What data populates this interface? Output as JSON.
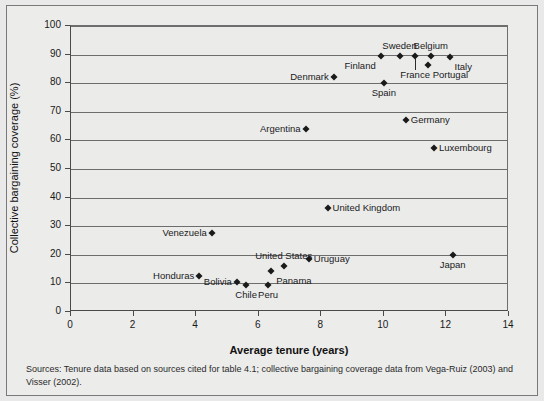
{
  "chart_data": {
    "type": "scatter",
    "title": "",
    "xlabel": "Average tenure (years)",
    "ylabel": "Collective bargaining coverage (%)",
    "xlim": [
      0,
      14
    ],
    "ylim": [
      0,
      100
    ],
    "xticks": [
      0,
      2,
      4,
      6,
      8,
      10,
      12,
      14
    ],
    "yticks": [
      0,
      10,
      20,
      30,
      40,
      50,
      60,
      70,
      80,
      90,
      100
    ],
    "grid": "horizontal",
    "legend": "none",
    "points": [
      {
        "label": "Sweden",
        "x": 10.5,
        "y": 89.5,
        "label_pos": "above",
        "leader": false
      },
      {
        "label": "Belgium",
        "x": 11.5,
        "y": 89.5,
        "label_pos": "above",
        "leader": false
      },
      {
        "label": "Italy",
        "x": 12.1,
        "y": 89.0,
        "label_pos": "below-right",
        "leader": false
      },
      {
        "label": "Finland",
        "x": 9.9,
        "y": 89.5,
        "label_pos": "below-left",
        "leader": false
      },
      {
        "label": "France",
        "x": 11.0,
        "y": 89.5,
        "label_pos": "below",
        "leader": true
      },
      {
        "label": "Portugal",
        "x": 11.4,
        "y": 86.5,
        "label_pos": "below-right",
        "leader": false
      },
      {
        "label": "Denmark",
        "x": 8.4,
        "y": 82.0,
        "label_pos": "left",
        "leader": false
      },
      {
        "label": "Spain",
        "x": 10.0,
        "y": 80.0,
        "label_pos": "below",
        "leader": false
      },
      {
        "label": "Germany",
        "x": 10.7,
        "y": 67.0,
        "label_pos": "right",
        "leader": false
      },
      {
        "label": "Argentina",
        "x": 7.5,
        "y": 64.0,
        "label_pos": "left",
        "leader": false
      },
      {
        "label": "Luxembourg",
        "x": 11.6,
        "y": 57.5,
        "label_pos": "right",
        "leader": false
      },
      {
        "label": "United Kingdom",
        "x": 8.2,
        "y": 36.5,
        "label_pos": "right",
        "leader": false
      },
      {
        "label": "Venezuela",
        "x": 4.5,
        "y": 27.5,
        "label_pos": "left",
        "leader": false
      },
      {
        "label": "Japan",
        "x": 12.2,
        "y": 20.0,
        "label_pos": "below",
        "leader": false
      },
      {
        "label": "Uruguay",
        "x": 7.6,
        "y": 18.5,
        "label_pos": "right",
        "leader": false
      },
      {
        "label": "United States",
        "x": 6.8,
        "y": 16.0,
        "label_pos": "above",
        "leader": false
      },
      {
        "label": "Panama",
        "x": 6.4,
        "y": 14.5,
        "label_pos": "below-right",
        "leader": false
      },
      {
        "label": "Honduras",
        "x": 4.1,
        "y": 12.5,
        "label_pos": "left",
        "leader": false
      },
      {
        "label": "Bolivia",
        "x": 5.3,
        "y": 10.5,
        "label_pos": "left",
        "leader": false
      },
      {
        "label": "Chile",
        "x": 5.6,
        "y": 9.5,
        "label_pos": "below",
        "leader": false
      },
      {
        "label": "Peru",
        "x": 6.3,
        "y": 9.5,
        "label_pos": "below",
        "leader": false
      }
    ]
  },
  "source_note": "Sources: Tenure data based on sources cited for table 4.1; collective bargaining coverage data from Vega-Ruiz (2003) and Visser (2002)."
}
